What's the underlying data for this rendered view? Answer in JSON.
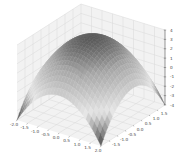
{
  "chart_data": {
    "type": "surface3d",
    "title": "",
    "function": "z = 4 - x^2 - y^2 (approx.)",
    "colormap": "gray",
    "xlabel": "",
    "ylabel": "",
    "zlabel": "",
    "xlim": [
      -2.0,
      2.0
    ],
    "ylim": [
      -2.0,
      2.0
    ],
    "zlim": [
      -4,
      4
    ],
    "x_ticks": [
      "-2.0",
      "-1.5",
      "-1.0",
      "-0.5",
      "0.0",
      "0.5",
      "1.0",
      "1.5",
      "2.0"
    ],
    "x_tick_values": [
      -2.0,
      -1.5,
      -1.0,
      -0.5,
      0.0,
      0.5,
      1.0,
      1.5,
      2.0
    ],
    "y_ticks": [
      "-1.5",
      "-1.0",
      "-0.5",
      "0.0",
      "0.5",
      "1.0",
      "1.5"
    ],
    "y_tick_values": [
      -1.5,
      -1.0,
      -0.5,
      0.0,
      0.5,
      1.0,
      1.5
    ],
    "z_ticks": [
      "4",
      "3",
      "2",
      "1",
      "0",
      "-1",
      "-2",
      "-3",
      "-4"
    ],
    "z_tick_values": [
      4,
      3,
      2,
      1,
      0,
      -1,
      -2,
      -3,
      -4
    ],
    "grid": true,
    "peak": {
      "x": 0,
      "y": 0,
      "z": 4
    },
    "corner_z": -4
  },
  "colors": {
    "pane": "#f2f2f2",
    "grid": "#d9d9d9",
    "surface_high": "#5a5a5a",
    "surface_low": "#e6e6e6"
  }
}
